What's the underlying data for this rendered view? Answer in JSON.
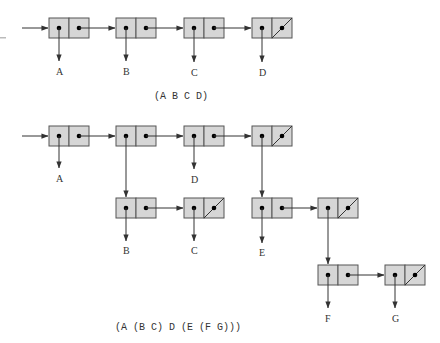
{
  "colors": {
    "cell_fill": "#d6d6d6",
    "cell_stroke": "#555555",
    "line": "#333333",
    "text": "#333333"
  },
  "icons": {
    "pointer": "filled-dot",
    "arrow": "arrowhead",
    "nil": "diagonal-slash"
  },
  "diagrams": [
    {
      "id": "flat-list",
      "caption": "(A B C D)",
      "caption_pos": [
        154,
        99
      ],
      "entry_arrow": {
        "from": [
          22,
          28
        ],
        "to": [
          49,
          28
        ]
      },
      "cells": [
        {
          "x": 49,
          "y": 18,
          "car": "A",
          "cdr": "next"
        },
        {
          "x": 116,
          "y": 18,
          "car": "B",
          "cdr": "next"
        },
        {
          "x": 184,
          "y": 18,
          "car": "C",
          "cdr": "next"
        },
        {
          "x": 252,
          "y": 18,
          "car": "D",
          "cdr": "nil"
        }
      ],
      "labels": [
        {
          "text": "A",
          "x": 59,
          "y": 75
        },
        {
          "text": "B",
          "x": 126,
          "y": 75
        },
        {
          "text": "C",
          "x": 194,
          "y": 76
        },
        {
          "text": "D",
          "x": 262,
          "y": 76
        }
      ]
    },
    {
      "id": "nested-list",
      "caption": "(A (B C) D (E (F G)))",
      "caption_pos": [
        115,
        330
      ],
      "entry_arrow": {
        "from": [
          22,
          136
        ],
        "to": [
          49,
          136
        ]
      },
      "cells": [
        {
          "x": 49,
          "y": 126,
          "car": "A",
          "cdr": "next"
        },
        {
          "x": 116,
          "y": 126,
          "car": "sublist-BC",
          "cdr": "next"
        },
        {
          "x": 184,
          "y": 126,
          "car": "D",
          "cdr": "next"
        },
        {
          "x": 252,
          "y": 126,
          "car": "sublist-E",
          "cdr": "nil"
        },
        {
          "x": 116,
          "y": 198,
          "car": "B",
          "cdr": "next"
        },
        {
          "x": 184,
          "y": 198,
          "car": "C",
          "cdr": "nil"
        },
        {
          "x": 252,
          "y": 198,
          "car": "E",
          "cdr": "next"
        },
        {
          "x": 318,
          "y": 198,
          "car": "sublist-FG",
          "cdr": "nil"
        },
        {
          "x": 318,
          "y": 265,
          "car": "F",
          "cdr": "next"
        },
        {
          "x": 385,
          "y": 265,
          "car": "G",
          "cdr": "nil"
        }
      ],
      "labels": [
        {
          "text": "A",
          "x": 59,
          "y": 182
        },
        {
          "text": "D",
          "x": 194,
          "y": 183
        },
        {
          "text": "B",
          "x": 126,
          "y": 254
        },
        {
          "text": "C",
          "x": 194,
          "y": 254
        },
        {
          "text": "E",
          "x": 262,
          "y": 256
        },
        {
          "text": "F",
          "x": 328,
          "y": 322
        },
        {
          "text": "G",
          "x": 395,
          "y": 322
        }
      ]
    }
  ]
}
